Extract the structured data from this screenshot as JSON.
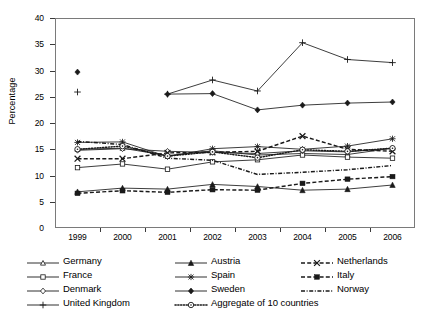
{
  "chart_data": {
    "type": "line",
    "title": "",
    "xlabel": "",
    "ylabel": "Percentage",
    "x": [
      1999,
      2000,
      2001,
      2002,
      2003,
      2004,
      2005,
      2006
    ],
    "xtick_labels": [
      "1999",
      "2000",
      "2001",
      "2002",
      "2003",
      "2004",
      "2005",
      "2006"
    ],
    "ytick_labels": [
      "0",
      "5",
      "10",
      "15",
      "20",
      "25",
      "30",
      "35",
      "40"
    ],
    "ylim": [
      0,
      40
    ],
    "ytick_step": 5,
    "grid": false,
    "legend_position": "below-axes",
    "series": [
      {
        "name": "Germany",
        "marker": "triangle-open",
        "line": "solid",
        "values": [
          15.0,
          15.2,
          13.8,
          14.7,
          13.9,
          14.2,
          14.0,
          15.2
        ]
      },
      {
        "name": "France",
        "marker": "square-open",
        "line": "solid",
        "values": [
          11.5,
          12.2,
          11.2,
          12.6,
          13.0,
          13.9,
          13.5,
          13.3
        ]
      },
      {
        "name": "Denmark",
        "marker": "diamond-open",
        "line": "solid",
        "values": [
          14.8,
          15.1,
          14.6,
          14.4,
          14.2,
          14.7,
          14.5,
          15.2
        ]
      },
      {
        "name": "United Kingdom",
        "marker": "plus",
        "line": "solid",
        "values": [
          25.9,
          null,
          25.5,
          28.2,
          26.1,
          35.3,
          32.1,
          31.5
        ]
      },
      {
        "name": "Austria",
        "marker": "triangle-filled",
        "line": "solid",
        "values": [
          6.9,
          7.6,
          7.4,
          8.3,
          7.9,
          7.2,
          7.4,
          8.2
        ]
      },
      {
        "name": "Spain",
        "marker": "asterisk",
        "line": "solid",
        "values": [
          16.3,
          16.4,
          13.6,
          15.1,
          15.5,
          15.0,
          15.6,
          17.0
        ]
      },
      {
        "name": "Sweden",
        "marker": "diamond-filled",
        "line": "solid",
        "values": [
          29.7,
          null,
          25.5,
          25.6,
          22.5,
          23.4,
          23.8,
          24.0
        ]
      },
      {
        "name": "Netherlands",
        "marker": "x",
        "line": "dashed",
        "values": [
          13.2,
          13.2,
          14.3,
          14.4,
          14.6,
          17.5,
          15.0,
          14.6
        ]
      },
      {
        "name": "Italy",
        "marker": "square-filled",
        "line": "dashed",
        "values": [
          6.6,
          7.1,
          6.8,
          7.3,
          7.2,
          8.5,
          9.3,
          9.8
        ]
      },
      {
        "name": "Norway",
        "marker": "none",
        "line": "dashdot",
        "values": [
          16.5,
          15.9,
          13.3,
          12.9,
          10.2,
          10.6,
          11.1,
          11.9
        ]
      },
      {
        "name": "Aggregate of 10 countries",
        "marker": "circle-dot",
        "line": "dotted",
        "values": [
          15.0,
          15.6,
          13.7,
          14.5,
          13.4,
          14.9,
          14.6,
          15.2
        ]
      }
    ]
  },
  "legend": {
    "entries": [
      {
        "label": "Germany"
      },
      {
        "label": "France"
      },
      {
        "label": "Denmark"
      },
      {
        "label": "United Kingdom"
      },
      {
        "label": "Austria"
      },
      {
        "label": "Spain"
      },
      {
        "label": "Sweden"
      },
      {
        "label": "Aggregate of 10 countries"
      },
      {
        "label": "Netherlands"
      },
      {
        "label": "Italy"
      },
      {
        "label": "Norway"
      }
    ]
  },
  "colors": {
    "line": "#1a1a1a",
    "frame": "#7a7a7a",
    "text": "#000000",
    "background": "#ffffff"
  }
}
